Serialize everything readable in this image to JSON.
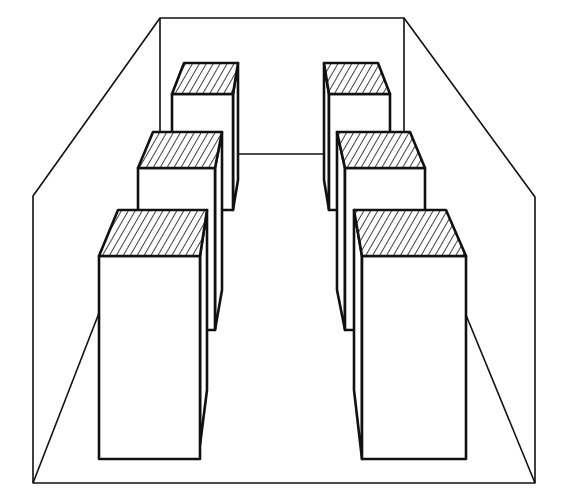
{
  "diagram": {
    "colors": {
      "line": "#111111",
      "background": "#ffffff"
    },
    "room": {
      "back_wall": [
        [
          160,
          18
        ],
        [
          404,
          18
        ],
        [
          404,
          154
        ],
        [
          160,
          154
        ]
      ],
      "left_wall": [
        [
          33,
          483
        ],
        [
          33,
          197
        ],
        [
          160,
          18
        ],
        [
          160,
          154
        ]
      ],
      "right_wall": [
        [
          535,
          483
        ],
        [
          535,
          197
        ],
        [
          404,
          18
        ],
        [
          404,
          154
        ]
      ],
      "floor_bottom": [
        [
          33,
          483
        ],
        [
          535,
          483
        ]
      ]
    },
    "boxes": [
      {
        "name": "left-back",
        "hatched_top": true
      },
      {
        "name": "left-middle",
        "hatched_top": true
      },
      {
        "name": "left-front",
        "hatched_top": true
      },
      {
        "name": "right-back",
        "hatched_top": true
      },
      {
        "name": "right-middle",
        "hatched_top": true
      },
      {
        "name": "right-front",
        "hatched_top": true
      }
    ]
  }
}
